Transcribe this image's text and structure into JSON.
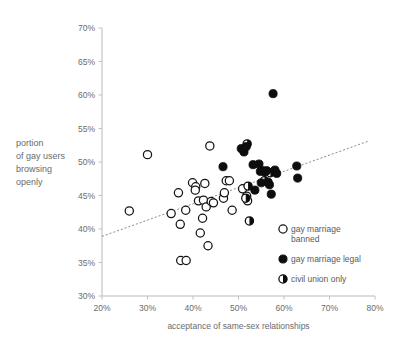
{
  "chart_data": {
    "type": "scatter",
    "title": "",
    "xlabel": "acceptance of same-sex relationships",
    "ylabel": "portion of gay users browsing openly",
    "ylabel_lines": [
      "portion",
      "of gay users",
      "browsing",
      "openly"
    ],
    "xlim": [
      20,
      80
    ],
    "ylim": [
      30,
      70
    ],
    "xticks": [
      20,
      30,
      40,
      50,
      60,
      70,
      80
    ],
    "yticks": [
      30,
      35,
      40,
      45,
      50,
      55,
      60,
      65,
      70
    ],
    "xtick_labels": [
      "20%",
      "30%",
      "40%",
      "50%",
      "60%",
      "70%",
      "80%"
    ],
    "ytick_labels": [
      "30%",
      "35%",
      "40%",
      "45%",
      "50%",
      "55%",
      "60%",
      "65%",
      "70%"
    ],
    "grid": false,
    "legend_position": "bottom-right",
    "legend": [
      {
        "key": "banned",
        "label_lines": [
          "gay marriage",
          "banned"
        ],
        "marker": "open-circle"
      },
      {
        "key": "legal",
        "label_lines": [
          "gay marriage legal"
        ],
        "marker": "filled-circle"
      },
      {
        "key": "civil",
        "label_lines": [
          "civil union only"
        ],
        "marker": "half-filled-circle"
      }
    ],
    "trendline": {
      "x": [
        20,
        78.5
      ],
      "y": [
        38.9,
        53.1
      ],
      "style": "dotted"
    },
    "series": [
      {
        "name": "gay marriage banned",
        "marker": "open-circle",
        "points": [
          [
            26.0,
            42.7
          ],
          [
            30.0,
            51.1
          ],
          [
            35.2,
            42.3
          ],
          [
            36.8,
            45.4
          ],
          [
            37.2,
            40.7
          ],
          [
            37.3,
            35.3
          ],
          [
            38.4,
            42.8
          ],
          [
            38.5,
            35.3
          ],
          [
            39.9,
            46.9
          ],
          [
            40.6,
            46.3
          ],
          [
            40.5,
            45.8
          ],
          [
            41.2,
            44.2
          ],
          [
            41.6,
            39.4
          ],
          [
            42.1,
            41.6
          ],
          [
            42.3,
            44.3
          ],
          [
            42.6,
            46.8
          ],
          [
            42.9,
            43.3
          ],
          [
            43.3,
            37.5
          ],
          [
            43.7,
            52.4
          ],
          [
            44.0,
            44.1
          ],
          [
            46.7,
            44.6
          ],
          [
            46.9,
            45.4
          ],
          [
            47.3,
            47.2
          ],
          [
            48.0,
            47.2
          ],
          [
            48.6,
            42.8
          ],
          [
            50.9,
            46.0
          ],
          [
            51.8,
            44.9
          ],
          [
            52.0,
            44.2
          ],
          [
            44.5,
            43.9
          ]
        ]
      },
      {
        "name": "gay marriage legal",
        "marker": "filled-circle",
        "points": [
          [
            46.6,
            49.3
          ],
          [
            50.6,
            52.0
          ],
          [
            51.2,
            51.5
          ],
          [
            51.7,
            52.3
          ],
          [
            53.2,
            49.6
          ],
          [
            54.5,
            49.7
          ],
          [
            54.8,
            48.6
          ],
          [
            55.3,
            48.7
          ],
          [
            55.8,
            48.5
          ],
          [
            56.2,
            48.7
          ],
          [
            56.5,
            47.0
          ],
          [
            56.8,
            46.6
          ],
          [
            57.2,
            45.2
          ],
          [
            57.6,
            60.2
          ],
          [
            58.0,
            48.8
          ],
          [
            58.4,
            48.3
          ],
          [
            62.8,
            49.4
          ],
          [
            63.0,
            47.6
          ],
          [
            53.6,
            45.8
          ],
          [
            55.0,
            46.9
          ]
        ]
      },
      {
        "name": "civil union only",
        "marker": "half-filled-circle",
        "points": [
          [
            51.9,
            52.7
          ],
          [
            52.1,
            46.4
          ],
          [
            51.6,
            44.6
          ],
          [
            52.4,
            41.2
          ],
          [
            55.7,
            47.2
          ],
          [
            57.0,
            48.4
          ]
        ]
      }
    ]
  }
}
